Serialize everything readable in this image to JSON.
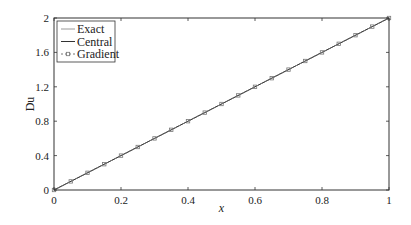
{
  "chart_data": {
    "type": "line",
    "title": "",
    "xlabel": "x",
    "ylabel": "Du",
    "xlim": [
      0,
      1
    ],
    "ylim": [
      0,
      2
    ],
    "x_ticks": [
      0,
      0.2,
      0.4,
      0.6,
      0.8,
      1
    ],
    "x_tick_labels": [
      "0",
      "0.2",
      "0.4",
      "0.6",
      "0.8",
      "1"
    ],
    "y_ticks": [
      0,
      0.4,
      0.8,
      1.2,
      1.6,
      2
    ],
    "y_tick_labels": [
      "0",
      "0.4",
      "0.8",
      "1.2",
      "1.6",
      "2"
    ],
    "grid": false,
    "legend_position": "top-left",
    "series": [
      {
        "name": "Exact",
        "style": "solid",
        "color": "#9a9a9a",
        "x": [
          0,
          1
        ],
        "y": [
          0,
          2
        ]
      },
      {
        "name": "Central",
        "style": "solid",
        "color": "#333333",
        "x": [
          0,
          1
        ],
        "y": [
          0,
          2
        ]
      },
      {
        "name": "Gradient",
        "style": "dotted-markers",
        "marker": "square",
        "color": "#777777",
        "x": [
          0,
          0.05,
          0.1,
          0.15,
          0.2,
          0.25,
          0.3,
          0.35,
          0.4,
          0.45,
          0.5,
          0.55,
          0.6,
          0.65,
          0.7,
          0.75,
          0.8,
          0.85,
          0.9,
          0.95,
          1.0
        ],
        "y": [
          0,
          0.1,
          0.2,
          0.3,
          0.4,
          0.5,
          0.6,
          0.7,
          0.8,
          0.9,
          1.0,
          1.1,
          1.2,
          1.3,
          1.4,
          1.5,
          1.6,
          1.7,
          1.8,
          1.9,
          2.0
        ]
      }
    ]
  }
}
